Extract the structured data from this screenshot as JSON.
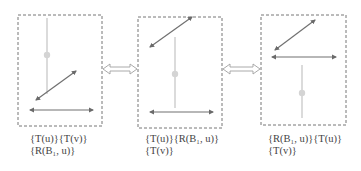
{
  "colors": {
    "box_border": "#777777",
    "arrow": "#707070",
    "arrowhead": "#6a6a6a",
    "stem": "#c8c8c8",
    "dot": "#d4d4d4",
    "connector": "#a0a0a0"
  },
  "panels": [
    {
      "id": "panel-1",
      "box": {
        "x": 18,
        "y": 15,
        "w": 84,
        "h": 111
      },
      "stem": {
        "x": 47,
        "y1": 18,
        "y2": 94,
        "dot_y": 55
      },
      "diagonal_arrow": {
        "x1": 36,
        "y1": 100,
        "x2": 76,
        "y2": 71
      },
      "horizontal_arrow": {
        "x1": 30,
        "x2": 93,
        "y": 110
      },
      "label_line1": "{T(u)}{T(v)}",
      "label_line2": "{R(B₁, u)}"
    },
    {
      "id": "panel-2",
      "box": {
        "x": 138,
        "y": 17,
        "w": 84,
        "h": 111
      },
      "stem": {
        "x": 175,
        "y1": 37,
        "y2": 108,
        "dot_y": 74
      },
      "diagonal_arrow": {
        "x1": 150,
        "y1": 47,
        "x2": 192,
        "y2": 17
      },
      "horizontal_arrow": {
        "x1": 150,
        "x2": 213,
        "y": 112
      },
      "label_line1": "{T(u)}{R(B₁, u)}",
      "label_line2": "{T(v)}"
    },
    {
      "id": "panel-3",
      "box": {
        "x": 261,
        "y": 15,
        "w": 85,
        "h": 110
      },
      "stem": {
        "x": 302,
        "y1": 65,
        "y2": 118,
        "dot_y": 93
      },
      "diagonal_arrow": {
        "x1": 275,
        "y1": 50,
        "x2": 315,
        "y2": 20
      },
      "horizontal_arrow": {
        "x1": 272,
        "x2": 336,
        "y": 57
      },
      "label_line1": "{R(B₁, u)}{T(u)}",
      "label_line2": "{T(v)}"
    }
  ],
  "connectors": [
    {
      "id": "connector-1-2",
      "x1": 103,
      "x2": 137,
      "y": 69
    },
    {
      "id": "connector-2-3",
      "x1": 223,
      "x2": 260,
      "y": 69
    }
  ]
}
